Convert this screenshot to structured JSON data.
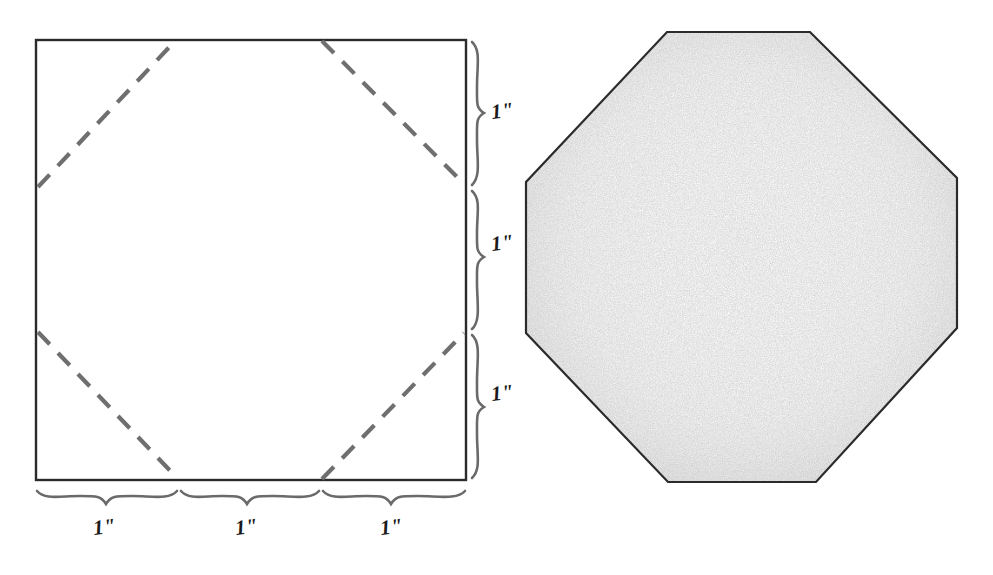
{
  "figure": {
    "type": "geometry-construction-diagram",
    "background_color": "#ffffff",
    "ink_color": "#2b2b2b",
    "dash_color": "#6f6f6f",
    "brace_color": "#6a6a6a",
    "shading_color": "#f2f2f2"
  },
  "left_panel": {
    "name": "square-with-dashed-cut-lines",
    "square": {
      "x": 36,
      "y": 40,
      "width": 430,
      "height": 440,
      "stroke_color": "#2b2b2b"
    },
    "cut_lines": {
      "style": "dashed",
      "color": "#6f6f6f",
      "dash": "18 12",
      "width": 4,
      "count": 4,
      "segments": [
        {
          "name": "top-left-cut",
          "x1": 38,
          "y1": 187,
          "x2": 175,
          "y2": 41
        },
        {
          "name": "top-right-cut",
          "x1": 322,
          "y1": 41,
          "x2": 464,
          "y2": 184
        },
        {
          "name": "bottom-left-cut",
          "x1": 38,
          "y1": 332,
          "x2": 178,
          "y2": 479
        },
        {
          "name": "bottom-right-cut",
          "x1": 322,
          "y1": 479,
          "x2": 464,
          "y2": 333
        }
      ]
    },
    "right_braces": [
      {
        "label": "1\"",
        "from": 40,
        "to": 187,
        "label_x": 497,
        "label_y": 117
      },
      {
        "label": "1\"",
        "from": 189,
        "to": 331,
        "label_x": 497,
        "label_y": 249
      },
      {
        "label": "1\"",
        "from": 333,
        "to": 480,
        "label_x": 497,
        "label_y": 400
      }
    ],
    "bottom_braces": [
      {
        "label": "1\"",
        "from": 36,
        "to": 178,
        "label_x": 100,
        "label_y": 535
      },
      {
        "label": "1\"",
        "from": 180,
        "to": 320,
        "label_x": 244,
        "label_y": 535
      },
      {
        "label": "1\"",
        "from": 322,
        "to": 466,
        "label_x": 390,
        "label_y": 535
      }
    ]
  },
  "right_panel": {
    "name": "shaded-octagon",
    "octagon_points": "667,32 810,32 957,178 957,328 816,482 668,482 526,333 526,182",
    "stroke_color": "#2b2b2b",
    "stroke_width": 2.2,
    "fill_color": "#f6f6f6"
  }
}
